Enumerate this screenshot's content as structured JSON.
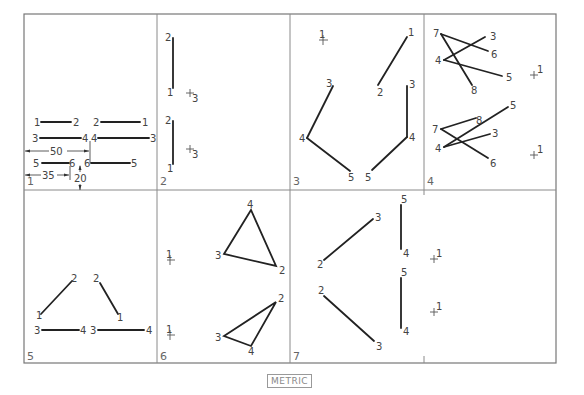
{
  "footer": {
    "unit_label": "METRIC"
  },
  "panels": [
    {
      "number": "1",
      "labels": {
        "a1": "1",
        "a2": "2",
        "b2": "2",
        "b1": "1",
        "c3": "3",
        "c4": "4",
        "d4": "4",
        "d3": "3",
        "e5": "5",
        "e6": "6",
        "f6": "6",
        "f5": "5"
      },
      "dimensions": {
        "width_50": "50",
        "width_35": "35",
        "height_20": "20"
      }
    },
    {
      "number": "2",
      "labels": {
        "t2": "2",
        "t1": "1",
        "t3": "3",
        "b2": "2",
        "b1": "1",
        "b3": "3"
      }
    },
    {
      "number": "3",
      "labels": {
        "p1": "1",
        "q1": "1",
        "q2": "2",
        "l3": "3",
        "l4": "4",
        "l5": "5",
        "r3": "3",
        "r4": "4",
        "r5": "5"
      }
    },
    {
      "number": "4",
      "labels": {
        "t7": "7",
        "t3": "3",
        "t6": "6",
        "t4": "4",
        "t5": "5",
        "t8": "8",
        "t1": "1",
        "b5": "5",
        "b8": "8",
        "b7": "7",
        "b3": "3",
        "b4": "4",
        "b6": "6",
        "b1": "1"
      }
    },
    {
      "number": "5",
      "labels": {
        "l2": "2",
        "l1": "1",
        "r2": "2",
        "r1": "1",
        "l3": "3",
        "l4": "4",
        "r3": "3",
        "r4": "4"
      }
    },
    {
      "number": "6",
      "labels": {
        "p1a": "1",
        "p1b": "1",
        "t4": "4",
        "t3": "3",
        "t2": "2",
        "b2": "2",
        "b3": "3",
        "b4": "4"
      }
    },
    {
      "number": "7",
      "labels": {
        "t3": "3",
        "t2": "2",
        "b2": "2",
        "b3": "3",
        "v5a": "5",
        "v4a": "4",
        "v5b": "5",
        "v4b": "4",
        "p1a": "1",
        "p1b": "1"
      }
    }
  ]
}
